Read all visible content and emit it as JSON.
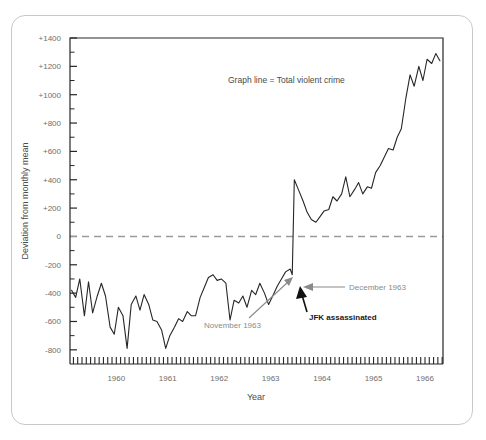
{
  "card": {
    "name": "chart-card"
  },
  "chart_data": {
    "type": "line",
    "title": "",
    "legend_text": "Graph line = Total violent crime",
    "xlabel": "Year",
    "ylabel": "Deviation from monthly mean",
    "xlim": [
      1959.6,
      1966.85
    ],
    "ylim": [
      -900,
      1400
    ],
    "yticks": [
      -800,
      -600,
      -400,
      -200,
      0,
      200,
      400,
      600,
      800,
      1000,
      1200,
      1400
    ],
    "ytick_labels": [
      "-800",
      "-600",
      "-400",
      "-200",
      "0",
      "+200",
      "+400",
      "+600",
      "+800",
      "+1000",
      "+1200",
      "+1400"
    ],
    "xticks": [
      1960,
      1961,
      1962,
      1963,
      1964,
      1965,
      1966
    ],
    "xtick_labels": [
      "1960",
      "1961",
      "1962",
      "1963",
      "1964",
      "1965",
      "1966"
    ],
    "grid": false,
    "minor_y_interval": 100,
    "minor_x_interval_months": 1,
    "zero_line": {
      "value": 0,
      "style": "dashed",
      "color": "#9a9a9a"
    },
    "line_color": "#262626",
    "series": [
      {
        "name": "Total violent crime",
        "x": [
          1959.63,
          1959.71,
          1959.79,
          1959.88,
          1959.96,
          1960.04,
          1960.13,
          1960.21,
          1960.29,
          1960.38,
          1960.46,
          1960.54,
          1960.63,
          1960.71,
          1960.79,
          1960.88,
          1960.96,
          1961.04,
          1961.13,
          1961.21,
          1961.29,
          1961.38,
          1961.46,
          1961.54,
          1961.63,
          1961.71,
          1961.79,
          1961.88,
          1961.96,
          1962.04,
          1962.13,
          1962.21,
          1962.29,
          1962.38,
          1962.46,
          1962.54,
          1962.63,
          1962.71,
          1962.79,
          1962.88,
          1962.96,
          1963.04,
          1963.13,
          1963.21,
          1963.29,
          1963.38,
          1963.46,
          1963.54,
          1963.63,
          1963.71,
          1963.79,
          1963.88,
          1963.92,
          1963.96,
          1964.04,
          1964.13,
          1964.21,
          1964.29,
          1964.38,
          1964.46,
          1964.54,
          1964.63,
          1964.71,
          1964.79,
          1964.88,
          1964.96,
          1965.04,
          1965.13,
          1965.21,
          1965.29,
          1965.38,
          1965.46,
          1965.54,
          1965.63,
          1965.71,
          1965.79,
          1965.88,
          1965.96,
          1966.04,
          1966.13,
          1966.21,
          1966.29,
          1966.38,
          1966.46,
          1966.54,
          1966.63,
          1966.71,
          1966.79
        ],
        "y": [
          -380,
          -430,
          -300,
          -560,
          -320,
          -540,
          -420,
          -330,
          -420,
          -640,
          -690,
          -500,
          -560,
          -790,
          -480,
          -420,
          -520,
          -410,
          -480,
          -590,
          -600,
          -660,
          -790,
          -700,
          -640,
          -580,
          -600,
          -530,
          -560,
          -560,
          -430,
          -360,
          -290,
          -270,
          -310,
          -300,
          -330,
          -590,
          -450,
          -470,
          -420,
          -500,
          -380,
          -410,
          -330,
          -400,
          -480,
          -420,
          -350,
          -300,
          -250,
          -230,
          -270,
          400,
          330,
          250,
          170,
          120,
          100,
          140,
          180,
          190,
          280,
          250,
          300,
          420,
          280,
          330,
          380,
          300,
          350,
          340,
          450,
          500,
          560,
          620,
          610,
          700,
          760,
          980,
          1140,
          1060,
          1200,
          1100,
          1250,
          1220,
          1290,
          1240
        ]
      }
    ],
    "annotations": [
      {
        "id": "november-1963",
        "label": "November 1963",
        "color": "#8a8a8a",
        "style": "gray"
      },
      {
        "id": "december-1963",
        "label": "December 1963",
        "color": "#8a8a8a",
        "style": "gray"
      },
      {
        "id": "jfk-assassinated",
        "label": "JFK assassinated",
        "color": "#1a1a1a",
        "style": "black-bold"
      }
    ]
  }
}
